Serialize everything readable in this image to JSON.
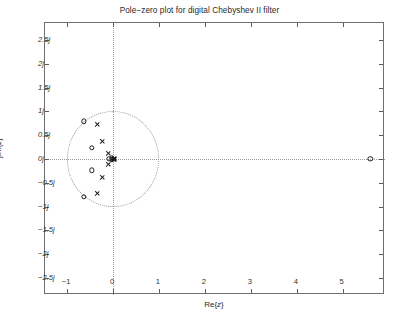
{
  "chart_data": {
    "type": "scatter",
    "title": "Pole−zero plot for digital Chebyshev II filter",
    "xlabel": "Re{z}",
    "ylabel": "jIm{z}",
    "xlim": [
      -1.48,
      5.92
    ],
    "ylim": [
      -2.86,
      2.86
    ],
    "grid": false,
    "legend": "none",
    "xticks": [
      -1,
      0,
      1,
      2,
      3,
      4,
      5
    ],
    "xtick_labels": [
      "−1",
      "0",
      "1",
      "2",
      "3",
      "4",
      "5"
    ],
    "yticks": [
      2.5,
      2,
      1.5,
      1,
      0.5,
      0,
      -0.5,
      -1,
      -1.5,
      -2,
      -2.5
    ],
    "ytick_labels": [
      "2.5j",
      "2j",
      "1.5j",
      "1j",
      "0.5j",
      "0j",
      "−0.5j",
      "−1j",
      "−1.5j",
      "−2j",
      "−2.5j"
    ],
    "annotations": [
      "dotted unit circle of radius 1 centered at origin",
      "dotted real axis",
      "dotted imaginary axis"
    ],
    "reference_circle": {
      "center": [
        0,
        0
      ],
      "radius": 1,
      "style": "dotted"
    },
    "series": [
      {
        "name": "zeros",
        "marker": "o",
        "count": 8,
        "points": [
          {
            "re": -0.63,
            "im": 0.79
          },
          {
            "re": -0.46,
            "im": 0.24
          },
          {
            "re": -0.08,
            "im": 0.0
          },
          {
            "re": -0.46,
            "im": -0.24
          },
          {
            "re": -0.63,
            "im": -0.79
          },
          {
            "re": 5.6,
            "im": 0.0
          },
          {
            "re": -0.02,
            "im": 0.02
          },
          {
            "re": -0.02,
            "im": -0.02
          }
        ]
      },
      {
        "name": "poles",
        "marker": "x",
        "count": 10,
        "points": [
          {
            "re": -0.33,
            "im": 0.73
          },
          {
            "re": -0.23,
            "im": 0.38
          },
          {
            "re": -0.1,
            "im": 0.12
          },
          {
            "re": -0.1,
            "im": -0.12
          },
          {
            "re": -0.23,
            "im": -0.38
          },
          {
            "re": -0.33,
            "im": -0.73
          },
          {
            "re": 0.02,
            "im": 0.01
          },
          {
            "re": 0.04,
            "im": 0.0
          },
          {
            "re": 0.02,
            "im": -0.01
          },
          {
            "re": 0.0,
            "im": 0.0
          }
        ]
      }
    ]
  }
}
